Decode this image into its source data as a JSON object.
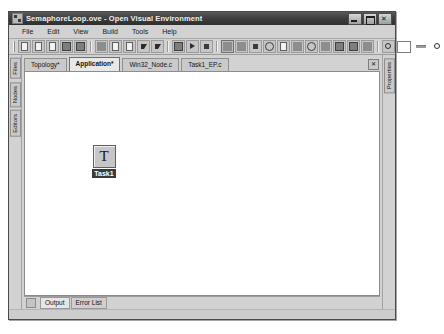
{
  "window": {
    "title": "SemaphoreLoop.ove - Open Visual Environment",
    "app_icon": "visual-environment-icon",
    "controls": {
      "minimize": "–",
      "maximize": "□",
      "close": "✕"
    }
  },
  "menu": {
    "items": [
      {
        "label": "File"
      },
      {
        "label": "Edit"
      },
      {
        "label": "View"
      },
      {
        "label": "Build"
      },
      {
        "label": "Tools"
      },
      {
        "label": "Help"
      }
    ]
  },
  "toolbar": {
    "groups": [
      {
        "buttons": [
          {
            "name": "new-file-icon",
            "kind": "doc"
          },
          {
            "name": "open-folder-icon",
            "kind": "doc"
          },
          {
            "name": "new-project-icon",
            "kind": "doc"
          },
          {
            "name": "save-icon",
            "kind": "disk"
          },
          {
            "name": "save-all-icon",
            "kind": "disk"
          }
        ]
      },
      {
        "buttons": [
          {
            "name": "cut-icon",
            "kind": "plain"
          },
          {
            "name": "copy-icon",
            "kind": "doc"
          },
          {
            "name": "paste-icon",
            "kind": "doc"
          },
          {
            "name": "undo-icon",
            "kind": "arrow"
          },
          {
            "name": "redo-icon",
            "kind": "arrow"
          }
        ]
      },
      {
        "buttons": [
          {
            "name": "build-icon",
            "kind": "disk"
          },
          {
            "name": "run-icon",
            "kind": "tri"
          },
          {
            "name": "stop-icon",
            "kind": "sq"
          }
        ]
      },
      {
        "buttons": [
          {
            "name": "pointer-tool-icon",
            "kind": "sunken"
          },
          {
            "name": "connect-tool-icon",
            "kind": "plain"
          },
          {
            "name": "node-tool-icon",
            "kind": "sq"
          },
          {
            "name": "ellipse-tool-icon",
            "kind": "circ"
          },
          {
            "name": "table-tool-icon",
            "kind": "doc"
          },
          {
            "name": "link-tool-icon",
            "kind": "plain"
          },
          {
            "name": "semaphore-tool-icon",
            "kind": "circ"
          },
          {
            "name": "channel-tool-icon",
            "kind": "plain"
          },
          {
            "name": "process-tool-icon",
            "kind": "disk"
          },
          {
            "name": "memory-tool-icon",
            "kind": "disk"
          },
          {
            "name": "pen-tool-icon",
            "kind": "plain"
          }
        ]
      },
      {
        "buttons": [
          {
            "name": "zoom-tool-icon",
            "kind": "mag"
          }
        ]
      }
    ],
    "zoom_slider": {
      "name": "zoom-slider"
    },
    "zoom_out_icon": "zoom-out-icon"
  },
  "left_panels": [
    {
      "label": "Files"
    },
    {
      "label": "Nodes"
    },
    {
      "label": "Editors"
    }
  ],
  "right_panels": [
    {
      "label": "Properties"
    }
  ],
  "document_tabs": {
    "tabs": [
      {
        "label": "Topology*",
        "active": false
      },
      {
        "label": "Application*",
        "active": true
      },
      {
        "label": "Win32_Node.c",
        "active": false
      },
      {
        "label": "Task1_EP.c",
        "active": false
      }
    ],
    "close_label": "✕"
  },
  "canvas": {
    "nodes": [
      {
        "glyph": "T",
        "label": "Task1",
        "selected": true
      }
    ]
  },
  "bottom_tabs": {
    "tabs": [
      {
        "label": "Output",
        "active": true
      },
      {
        "label": "Error List",
        "active": false
      }
    ]
  }
}
